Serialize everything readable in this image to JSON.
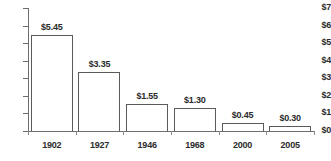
{
  "chart_data": {
    "type": "bar",
    "title": "",
    "subtitle": "",
    "xlabel": "",
    "ylabel": "",
    "categories": [
      "1902",
      "1927",
      "1946",
      "1968",
      "2000",
      "2005"
    ],
    "values": [
      5.45,
      3.35,
      1.55,
      1.3,
      0.45,
      0.3
    ],
    "value_labels": [
      "$5.45",
      "$3.35",
      "$1.55",
      "$1.30",
      "$0.45",
      "$0.30"
    ],
    "ylim": [
      0,
      7
    ],
    "ytick_values": [
      7,
      6,
      5,
      4,
      3,
      2,
      1,
      0
    ],
    "ytick_labels": [
      "$7",
      "$6",
      "$5",
      "$4",
      "$3",
      "$2",
      "$1",
      "$0"
    ],
    "grid": false,
    "legend": null,
    "series": [
      {
        "name": "",
        "values": [
          5.45,
          3.35,
          1.55,
          1.3,
          0.45,
          0.3
        ]
      }
    ],
    "colors": {
      "bar_fill": "#ffffff",
      "bar_outline": "#5a5a5a",
      "axis": "#6e6e6e",
      "text": "#2b2b2b",
      "background": "#ffffff"
    }
  }
}
